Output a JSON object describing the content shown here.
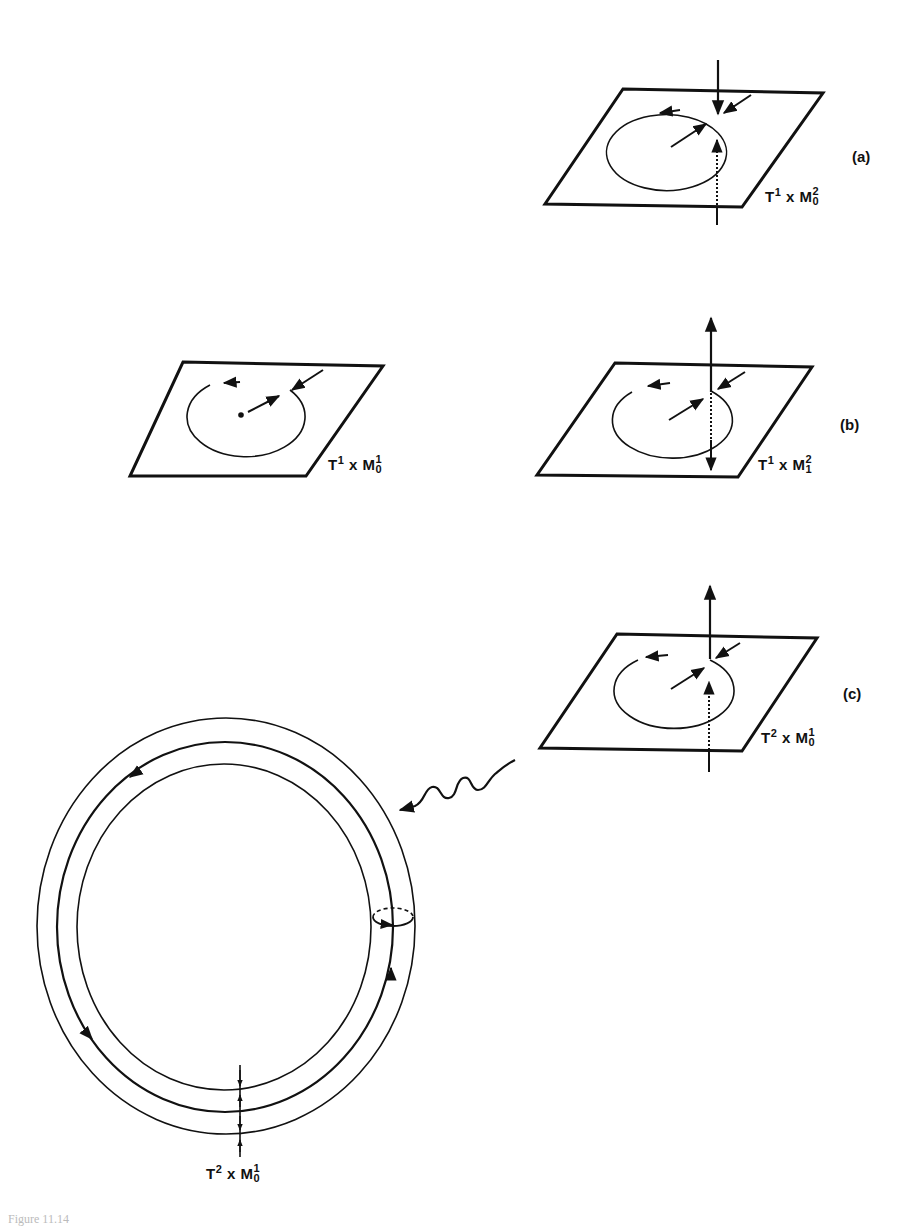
{
  "figure": {
    "caption_fragment": "Figure 11.14"
  },
  "panels": {
    "a": {
      "label": "(a)",
      "manifold": {
        "base": "T",
        "base_sup": "1",
        "times": "x",
        "fiber": "M",
        "fiber_sup": "2",
        "fiber_sub": "0"
      }
    },
    "b_left": {
      "manifold": {
        "base": "T",
        "base_sup": "1",
        "times": "x",
        "fiber": "M",
        "fiber_sup": "1",
        "fiber_sub": "0"
      }
    },
    "b": {
      "label": "(b)",
      "manifold": {
        "base": "T",
        "base_sup": "1",
        "times": "x",
        "fiber": "M",
        "fiber_sup": "2",
        "fiber_sub": "1"
      }
    },
    "c": {
      "label": "(c)",
      "manifold": {
        "base": "T",
        "base_sup": "2",
        "times": "x",
        "fiber": "M",
        "fiber_sup": "1",
        "fiber_sub": "0"
      }
    },
    "torus": {
      "manifold": {
        "base": "T",
        "base_sup": "2",
        "times": "x",
        "fiber": "M",
        "fiber_sup": "1",
        "fiber_sub": "0"
      }
    }
  },
  "colors": {
    "ink": "#111111",
    "background": "#ffffff"
  }
}
